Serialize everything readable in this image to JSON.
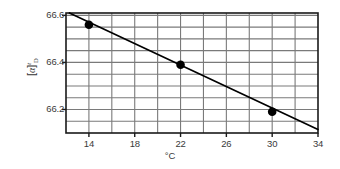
{
  "chart_data": {
    "type": "scatter",
    "title": "",
    "subtitle": "",
    "xlabel": "°C",
    "ylabel": "[α]",
    "ylabel_sup": "t",
    "ylabel_sub": "D",
    "ylabel_full": "[α]t D",
    "x": [
      14,
      22,
      30
    ],
    "values": [
      66.56,
      66.39,
      66.19
    ],
    "series": [
      {
        "name": "specific rotation measurements",
        "x": [
          14,
          22,
          30
        ],
        "values": [
          66.56,
          66.39,
          66.19
        ],
        "marker": "filled-circle",
        "marker_color": "#000000"
      }
    ],
    "trendline": {
      "name": "least-squares fit",
      "x_start": 12.3,
      "y_start": 66.61,
      "x_end": 34.0,
      "y_end": 66.115,
      "color": "#000000"
    },
    "xlim": [
      12,
      34
    ],
    "ylim": [
      66.1,
      66.61
    ],
    "xticks": [
      14,
      18,
      22,
      26,
      30,
      34
    ],
    "xtick_labels": [
      "14",
      "18",
      "22",
      "26",
      "30",
      "34"
    ],
    "yticks": [
      66.2,
      66.4,
      66.6
    ],
    "ytick_labels": [
      "66.2",
      "66.4",
      "66.6"
    ],
    "x_gridlines": [
      12,
      14,
      16,
      18,
      20,
      22,
      24,
      26,
      28,
      30,
      32,
      34
    ],
    "y_gridlines": [
      66.15,
      66.2,
      66.25,
      66.3,
      66.35,
      66.4,
      66.45,
      66.5,
      66.55,
      66.6
    ],
    "grid": true,
    "legend": "none",
    "frame_color": "#1a1a1a",
    "grid_color": "#7a7a7a",
    "background": "#ffffff"
  }
}
